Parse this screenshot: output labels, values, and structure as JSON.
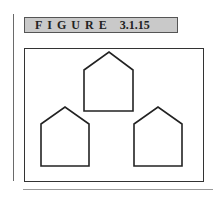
{
  "figure": {
    "label_word": "FIGURE",
    "label_number": "3.1.15",
    "label_background": "#c9c9c9"
  },
  "diagram": {
    "shapes": [
      {
        "name": "house-top",
        "points": [
          [
            84,
            70
          ],
          [
            109,
            52
          ],
          [
            133,
            70
          ],
          [
            133,
            111
          ],
          [
            84,
            111
          ]
        ]
      },
      {
        "name": "house-left",
        "points": [
          [
            41,
            124
          ],
          [
            65,
            107
          ],
          [
            89,
            124
          ],
          [
            89,
            166
          ],
          [
            41,
            166
          ]
        ]
      },
      {
        "name": "house-right",
        "points": [
          [
            134,
            124
          ],
          [
            158,
            107
          ],
          [
            182,
            124
          ],
          [
            182,
            166
          ],
          [
            134,
            166
          ]
        ]
      }
    ],
    "stroke_color": "#222222"
  }
}
